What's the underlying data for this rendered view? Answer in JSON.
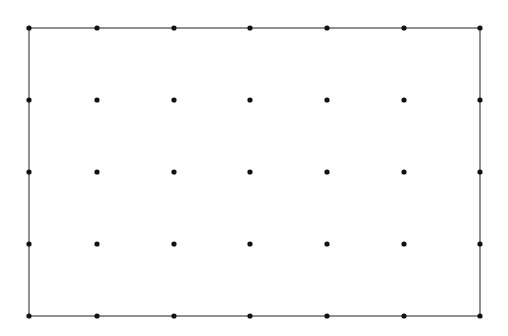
{
  "diagram": {
    "type": "dot-grid",
    "columns": [
      29,
      97,
      174,
      250,
      327,
      404,
      480
    ],
    "rows": [
      28,
      100,
      172,
      244,
      316
    ],
    "border": {
      "x1": 29,
      "y1": 28,
      "x2": 480,
      "y2": 316
    },
    "colors": {
      "background": "#ffffff",
      "border": "#555555",
      "dot": "#111111"
    },
    "dot_radius": 2.6,
    "border_width": 1.3
  }
}
